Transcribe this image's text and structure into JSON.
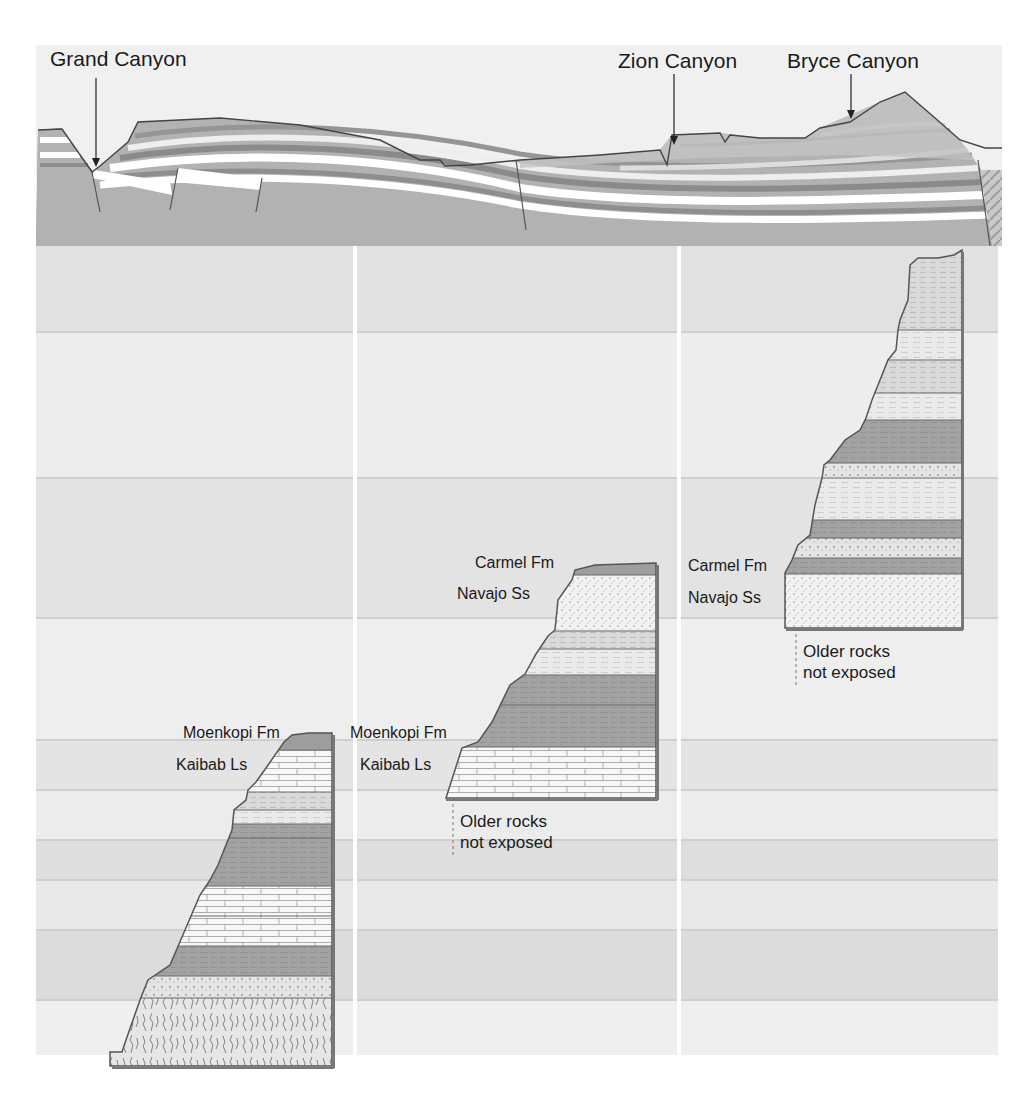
{
  "diagram": {
    "type": "stratigraphic-cross-section",
    "cross_section": {
      "locations": [
        {
          "name": "Grand Canyon",
          "label": "Grand Canyon"
        },
        {
          "name": "Zion Canyon",
          "label": "Zion Canyon"
        },
        {
          "name": "Bryce Canyon",
          "label": "Bryce Canyon"
        }
      ]
    },
    "columns": [
      {
        "name": "grand-canyon-column",
        "labels": {
          "top_formation": "Moenkopi Fm",
          "second_formation": "Kaibab Ls"
        }
      },
      {
        "name": "zion-column",
        "labels": {
          "top_formation": "Carmel Fm",
          "second_formation": "Navajo Ss",
          "lower_formation_a": "Moenkopi Fm",
          "lower_formation_b": "Kaibab Ls",
          "base_note_line1": "Older rocks",
          "base_note_line2": "not exposed"
        }
      },
      {
        "name": "bryce-column",
        "labels": {
          "lower_formation_a": "Carmel Fm",
          "lower_formation_b": "Navajo Ss",
          "base_note_line1": "Older rocks",
          "base_note_line2": "not exposed"
        }
      }
    ],
    "colors": {
      "band_light": "#ececec",
      "band_mid": "#e2e2e2",
      "band_dark": "#d6d6d6",
      "shale": "#9c9c9c",
      "sandstone": "#f2f2f2",
      "limestone": "#f6f6f6",
      "outline": "#555555",
      "basement": "#a8a8a8"
    }
  }
}
